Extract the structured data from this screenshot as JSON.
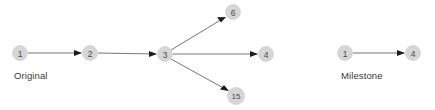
{
  "canvas": {
    "width": 435,
    "height": 110,
    "background": "#ffffff"
  },
  "style": {
    "node_fill": "#d6d6d6",
    "node_stroke": "#c9c9c9",
    "node_text_color": "#4a4a4a",
    "edge_color": "#666666",
    "arrow_color": "#1c1c1c",
    "caption_color": "#3a3a3a"
  },
  "diagrams": [
    {
      "id": "original",
      "caption": "Original",
      "nodes": [
        {
          "id": "o1",
          "label": "1",
          "cx": 20,
          "cy": 53,
          "r": 7.5
        },
        {
          "id": "o2",
          "label": "2",
          "cx": 90,
          "cy": 53,
          "r": 7.5
        },
        {
          "id": "o3",
          "label": "3",
          "cx": 165,
          "cy": 54,
          "r": 7.5
        },
        {
          "id": "o6",
          "label": "6",
          "cx": 233,
          "cy": 12,
          "r": 7.5
        },
        {
          "id": "o4",
          "label": "4",
          "cx": 266,
          "cy": 54,
          "r": 7.5
        },
        {
          "id": "o15",
          "label": "15",
          "cx": 236,
          "cy": 96,
          "r": 8.5
        }
      ],
      "edges": [
        {
          "from": "o1",
          "to": "o2",
          "x1": 28,
          "y1": 53,
          "x2": 82,
          "y2": 53
        },
        {
          "from": "o2",
          "to": "o3",
          "x1": 98,
          "y1": 53,
          "x2": 157,
          "y2": 54
        },
        {
          "from": "o3",
          "to": "o6",
          "x1": 171,
          "y1": 50,
          "x2": 226,
          "y2": 17
        },
        {
          "from": "o3",
          "to": "o4",
          "x1": 173,
          "y1": 54,
          "x2": 258,
          "y2": 54
        },
        {
          "from": "o3",
          "to": "o15",
          "x1": 171,
          "y1": 59,
          "x2": 229,
          "y2": 91
        }
      ]
    },
    {
      "id": "milestone",
      "caption": "Milestone",
      "nodes": [
        {
          "id": "m1",
          "label": "1",
          "cx": 345,
          "cy": 53,
          "r": 7.5
        },
        {
          "id": "m4",
          "label": "4",
          "cx": 413,
          "cy": 53,
          "r": 7.5
        }
      ],
      "edges": [
        {
          "from": "m1",
          "to": "m4",
          "x1": 353,
          "y1": 53,
          "x2": 405,
          "y2": 53
        }
      ]
    }
  ]
}
